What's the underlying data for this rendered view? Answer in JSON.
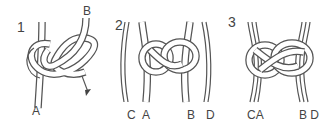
{
  "diagram": {
    "panels": [
      {
        "step": "1",
        "labels": {
          "left": "A",
          "right": "B"
        },
        "arrow": "down-right-arrow"
      },
      {
        "step": "2",
        "labels": {
          "c": "C",
          "a": "A",
          "b": "B",
          "d": "D"
        }
      },
      {
        "step": "3",
        "labels": {
          "ca": "CA",
          "bd": "B D"
        }
      }
    ]
  }
}
